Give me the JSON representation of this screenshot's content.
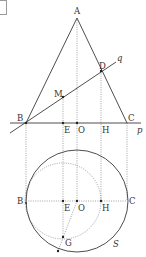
{
  "figure": {
    "corner_marker": "",
    "colors": {
      "line": "#3a3a3a",
      "dotted": "#7a7a7a",
      "background": "#ffffff"
    },
    "upper": {
      "points": {
        "A": {
          "label": "A",
          "x": 77,
          "y": 18
        },
        "B": {
          "label": "B",
          "x": 26,
          "y": 123
        },
        "C": {
          "label": "C",
          "x": 127,
          "y": 123
        },
        "D": {
          "label": "D",
          "x": 101,
          "y": 71
        },
        "M": {
          "label": "M",
          "x": 63,
          "y": 97
        },
        "E": {
          "label": "E",
          "x": 63,
          "y": 123
        },
        "O": {
          "label": "O",
          "x": 77,
          "y": 123
        },
        "H": {
          "label": "H",
          "x": 101,
          "y": 123
        }
      },
      "lines": {
        "p": {
          "label": "p"
        },
        "q": {
          "label": "q"
        }
      }
    },
    "lower": {
      "circle_S": {
        "label": "S",
        "cx": 77,
        "cy": 201,
        "r": 51
      },
      "dotted_circle": {
        "cx": 63,
        "cy": 201,
        "r": 38
      },
      "points": {
        "B": {
          "label": "B"
        },
        "C": {
          "label": "C"
        },
        "E": {
          "label": "E"
        },
        "O": {
          "label": "O"
        },
        "H": {
          "label": "H"
        },
        "G": {
          "label": "G"
        }
      }
    }
  }
}
